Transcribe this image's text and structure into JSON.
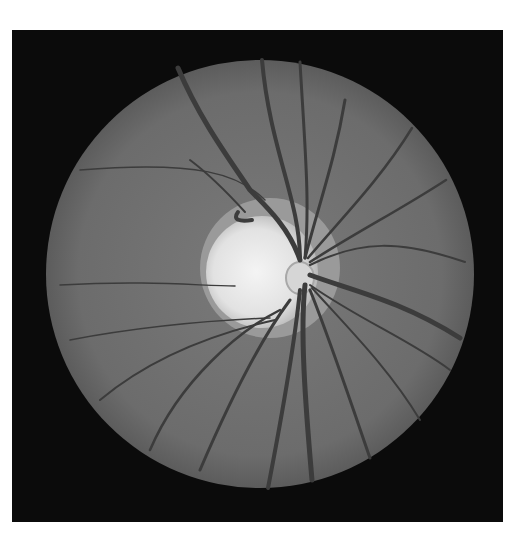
{
  "image": {
    "subject": "Fundus photograph of retina (grayscale)",
    "frame_color": "#0b0b0b",
    "fundus_color": "#6e6e6e",
    "disc_color": "#ececec",
    "vessel_color": "#3a3a3a",
    "optic_disc": {
      "cx": 258,
      "cy": 272,
      "r": 52
    },
    "fundus": {
      "cx": 260,
      "cy": 274,
      "r": 214
    }
  }
}
